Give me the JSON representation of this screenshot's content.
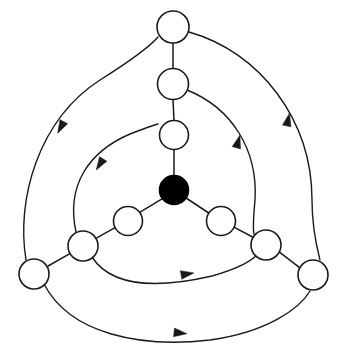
{
  "figure": {
    "width": 345,
    "height": 358,
    "background_color": "#ffffff",
    "stroke_color": "#1a1a1a",
    "node_fill_white": "#ffffff",
    "node_fill_black": "#000000",
    "node_stroke_width": 1.6,
    "edge_stroke_width": 1.5,
    "arc_stroke_width": 1.4
  },
  "nodes": [
    {
      "id": "center",
      "label": "",
      "cx": 174,
      "cy": 190,
      "r": 14.5,
      "fill": "#000000",
      "stroke": "#000000",
      "kind": "filled-hub"
    },
    {
      "id": "n-top-inner",
      "label": "",
      "cx": 174,
      "cy": 135,
      "r": 14.5,
      "fill": "#ffffff",
      "stroke": "#1a1a1a",
      "kind": "open"
    },
    {
      "id": "n-top-mid",
      "label": "",
      "cx": 173,
      "cy": 84,
      "r": 15.5,
      "fill": "#ffffff",
      "stroke": "#1a1a1a",
      "kind": "open"
    },
    {
      "id": "n-top-outer",
      "label": "",
      "cx": 173,
      "cy": 27,
      "r": 16.0,
      "fill": "#ffffff",
      "stroke": "#1a1a1a",
      "kind": "open"
    },
    {
      "id": "n-left-inner",
      "label": "",
      "cx": 128,
      "cy": 221,
      "r": 14.5,
      "fill": "#ffffff",
      "stroke": "#1a1a1a",
      "kind": "open"
    },
    {
      "id": "n-left-mid",
      "label": "",
      "cx": 83,
      "cy": 246,
      "r": 15.0,
      "fill": "#ffffff",
      "stroke": "#1a1a1a",
      "kind": "open"
    },
    {
      "id": "n-left-outer",
      "label": "",
      "cx": 34,
      "cy": 274,
      "r": 15.0,
      "fill": "#ffffff",
      "stroke": "#1a1a1a",
      "kind": "open"
    },
    {
      "id": "n-right-inner",
      "label": "",
      "cx": 221,
      "cy": 221,
      "r": 14.5,
      "fill": "#ffffff",
      "stroke": "#1a1a1a",
      "kind": "open"
    },
    {
      "id": "n-right-mid",
      "label": "",
      "cx": 266,
      "cy": 245,
      "r": 15.0,
      "fill": "#ffffff",
      "stroke": "#1a1a1a",
      "kind": "open"
    },
    {
      "id": "n-right-outer",
      "label": "",
      "cx": 313,
      "cy": 275,
      "r": 15.0,
      "fill": "#ffffff",
      "stroke": "#1a1a1a",
      "kind": "open"
    }
  ],
  "spokes": [
    {
      "id": "spoke-center-top",
      "from": "center",
      "to": "n-top-inner",
      "d": "M 174 175.5 L 174 149.5"
    },
    {
      "id": "spoke-top-chain-1",
      "from": "n-top-inner",
      "to": "n-top-mid",
      "d": "M 174 120.5 L 173 99.5"
    },
    {
      "id": "spoke-top-chain-2",
      "from": "n-top-mid",
      "to": "n-top-outer",
      "d": "M 173 68.5 L 173 43"
    },
    {
      "id": "spoke-center-left",
      "from": "center",
      "to": "n-left-inner",
      "d": "M 162.4 198.7 L 139.3 212.6"
    },
    {
      "id": "spoke-left-chain-1",
      "from": "n-left-inner",
      "to": "n-left-mid",
      "d": "M 115.0 227.6 L 96.8 237.8"
    },
    {
      "id": "spoke-left-chain-2",
      "from": "n-left-mid",
      "to": "n-left-outer",
      "d": "M 69.4 253.8 L 48.1 266.0"
    },
    {
      "id": "spoke-center-right",
      "from": "center",
      "to": "n-right-inner",
      "d": "M 186.1 198.0 L 209.5 213.5"
    },
    {
      "id": "spoke-right-chain-1",
      "from": "n-right-inner",
      "to": "n-right-mid",
      "d": "M 234.4 227.3 L 252.5 237.0"
    },
    {
      "id": "spoke-right-chain-2",
      "from": "n-right-mid",
      "to": "n-right-outer",
      "d": "M 279.8 252.3 L 299.6 267.6"
    }
  ],
  "arcs": [
    {
      "id": "arc-top-outer-to-right-outer",
      "from": "n-top-outer",
      "to": "n-right-outer",
      "layer": "outer",
      "d": "M 189 32 C 260 52 312 120 312 200 C 312 230 318 252 320 260",
      "arrow_at": {
        "x": 288,
        "y": 120,
        "angle": -78
      }
    },
    {
      "id": "arc-top-mid-to-right-mid",
      "from": "n-top-mid",
      "to": "n-right-mid",
      "layer": "middle",
      "d": "M 187 90 C 232 108 258 150 255 200 C 253 222 253 230 254 234",
      "arrow_at": {
        "x": 238,
        "y": 142,
        "angle": -74
      }
    },
    {
      "id": "arc-left-outer-to-top-outer",
      "from": "n-left-outer",
      "to": "n-top-outer",
      "layer": "outer",
      "d": "M 26 260 C 16 200 38 120 100 80 C 135 58 152 44 158 37",
      "arrow_at": {
        "x": 61,
        "y": 127,
        "angle": 118
      }
    },
    {
      "id": "arc-left-mid-to-top-mid",
      "from": "n-left-mid",
      "to": "n-top-mid",
      "layer": "middle",
      "d": "M 76 232 C 66 186 88 152 130 134 C 148 127 154 125 158 124",
      "arrow_at": {
        "x": 100,
        "y": 164,
        "angle": 122
      }
    },
    {
      "id": "arc-left-outer-to-right-outer",
      "from": "n-left-outer",
      "to": "n-right-outer",
      "layer": "outer",
      "d": "M 44 284 C 70 334 140 348 210 340 C 268 332 300 308 310 291",
      "arrow_at": {
        "x": 180,
        "y": 333,
        "angle": 6
      }
    },
    {
      "id": "arc-left-mid-to-right-mid",
      "from": "n-left-mid",
      "to": "n-right-mid",
      "layer": "middle",
      "d": "M 92 257 C 112 288 160 288 212 276 C 240 268 252 260 257 255",
      "arrow_at": {
        "x": 187,
        "y": 274,
        "angle": -9
      }
    }
  ],
  "legend": {
    "hub_description": "filled node",
    "node_description": "open node",
    "edge_description": "undirected spoke",
    "arc_description": "directed arc"
  }
}
